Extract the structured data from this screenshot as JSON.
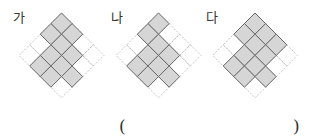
{
  "figures": [
    {
      "label": "가",
      "label_x": 13,
      "cx": 61.5,
      "filled": [
        [
          0,
          0
        ],
        [
          0,
          1
        ],
        [
          1,
          0
        ],
        [
          1,
          1
        ],
        [
          1,
          2
        ],
        [
          2,
          1
        ],
        [
          2,
          2
        ],
        [
          3,
          1
        ],
        [
          3,
          2
        ],
        [
          2,
          3
        ]
      ]
    },
    {
      "label": "나",
      "label_x": 111,
      "cx": 158.5,
      "filled": [
        [
          0,
          0
        ],
        [
          1,
          0
        ],
        [
          1,
          1
        ],
        [
          1,
          2
        ],
        [
          2,
          1
        ],
        [
          2,
          2
        ],
        [
          3,
          1
        ],
        [
          3,
          2
        ],
        [
          2,
          3
        ]
      ]
    },
    {
      "label": "다",
      "label_x": 206,
      "cx": 255,
      "filled": [
        [
          0,
          0
        ],
        [
          0,
          1
        ],
        [
          0,
          2
        ],
        [
          1,
          0
        ],
        [
          1,
          1
        ],
        [
          1,
          2
        ],
        [
          2,
          1
        ],
        [
          2,
          2
        ],
        [
          3,
          1
        ],
        [
          3,
          2
        ],
        [
          2,
          3
        ]
      ]
    }
  ],
  "grid": {
    "size": 4,
    "top_y": 13,
    "half_diag": 10.6
  },
  "colors": {
    "fill": "#d6d6d6",
    "stroke": "#6a6a6a",
    "dotted": "#b8b8b8",
    "text": "#333333"
  },
  "answer": {
    "open": "(",
    "close": ")"
  }
}
